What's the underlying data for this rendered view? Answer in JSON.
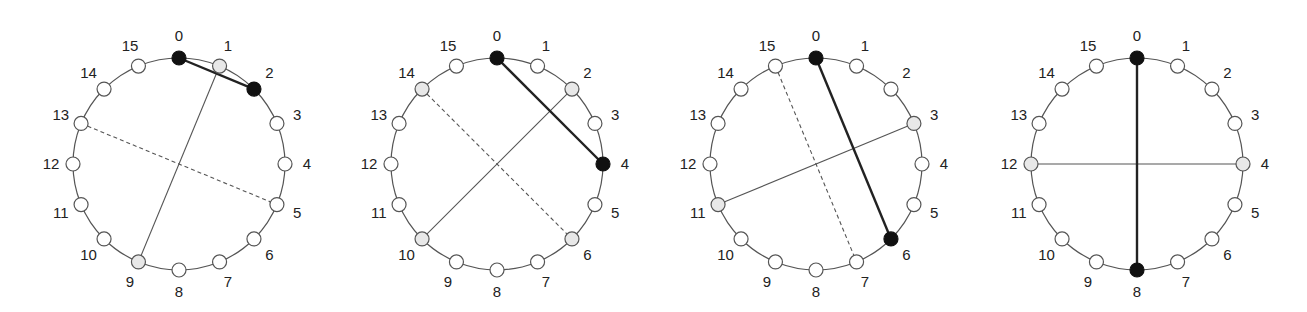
{
  "figure": {
    "node_count": 16,
    "node_labels": [
      "0",
      "1",
      "2",
      "3",
      "4",
      "5",
      "6",
      "7",
      "8",
      "9",
      "10",
      "11",
      "12",
      "13",
      "14",
      "15"
    ],
    "colors": {
      "black_node": "#111111",
      "gray_node": "#e8e8e8",
      "white_node": "#ffffff",
      "ring": "#555555"
    },
    "panels": [
      {
        "id": "panel-1",
        "center": [
          179,
          164
        ],
        "radius": 106,
        "black_nodes": [
          0,
          2
        ],
        "gray_nodes": [
          1,
          9
        ],
        "edges": [
          {
            "from": 0,
            "to": 2,
            "style": "thick"
          },
          {
            "from": 1,
            "to": 9,
            "style": "thin"
          },
          {
            "from": 13,
            "to": 5,
            "style": "dashed"
          }
        ]
      },
      {
        "id": "panel-2",
        "center": [
          497,
          164
        ],
        "radius": 106,
        "black_nodes": [
          0,
          4
        ],
        "gray_nodes": [
          2,
          10,
          14,
          6
        ],
        "edges": [
          {
            "from": 0,
            "to": 4,
            "style": "thick"
          },
          {
            "from": 2,
            "to": 10,
            "style": "thin"
          },
          {
            "from": 14,
            "to": 6,
            "style": "dashed"
          }
        ]
      },
      {
        "id": "panel-3",
        "center": [
          816,
          164
        ],
        "radius": 106,
        "black_nodes": [
          0,
          6
        ],
        "gray_nodes": [
          3,
          11
        ],
        "edges": [
          {
            "from": 0,
            "to": 6,
            "style": "thick"
          },
          {
            "from": 3,
            "to": 11,
            "style": "thin"
          },
          {
            "from": 15,
            "to": 7,
            "style": "dashed"
          }
        ]
      },
      {
        "id": "panel-4",
        "center": [
          1137,
          164
        ],
        "radius": 106,
        "black_nodes": [
          0,
          8
        ],
        "gray_nodes": [
          4,
          12
        ],
        "edges": [
          {
            "from": 0,
            "to": 8,
            "style": "thick"
          },
          {
            "from": 12,
            "to": 4,
            "style": "thin"
          }
        ]
      }
    ]
  }
}
